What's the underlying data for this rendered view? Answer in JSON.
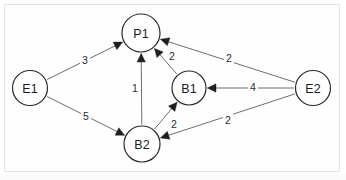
{
  "diagram": {
    "title": "",
    "type": "directed-weighted-graph",
    "background_color": "#ffffff",
    "frame_color": "#e3e3e3",
    "node_stroke_color": "#2a2a2a",
    "edge_color": "#6e6e6e",
    "arrow_color": "#1f1f1f",
    "nodes": [
      {
        "id": "E1",
        "label": "E1",
        "cx": 30,
        "cy": 88,
        "r": 17.5
      },
      {
        "id": "P1",
        "label": "P1",
        "cx": 141,
        "cy": 33,
        "r": 19.0
      },
      {
        "id": "B1",
        "label": "B1",
        "cx": 189,
        "cy": 88,
        "r": 17.0
      },
      {
        "id": "B2",
        "label": "B2",
        "cx": 142,
        "cy": 144,
        "r": 18.0
      },
      {
        "id": "E2",
        "label": "E2",
        "cx": 313,
        "cy": 88,
        "r": 17.5
      }
    ],
    "edges": [
      {
        "id": "e1-p1",
        "from": "E1",
        "to": "P1",
        "weight": "3",
        "label_x": 85,
        "label_y": 60
      },
      {
        "id": "e1-b2",
        "from": "E1",
        "to": "B2",
        "weight": "5",
        "label_x": 86,
        "label_y": 116
      },
      {
        "id": "b2-p1",
        "from": "B2",
        "to": "P1",
        "weight": "1",
        "label_x": 135,
        "label_y": 88
      },
      {
        "id": "b1-p1",
        "from": "B1",
        "to": "P1",
        "weight": "2",
        "label_x": 172,
        "label_y": 56
      },
      {
        "id": "e2-p1",
        "from": "E2",
        "to": "P1",
        "weight": "2",
        "label_x": 229,
        "label_y": 58
      },
      {
        "id": "e2-b1",
        "from": "E2",
        "to": "B1",
        "weight": "4",
        "label_x": 253,
        "label_y": 87
      },
      {
        "id": "b2-b1",
        "from": "B2",
        "to": "B1",
        "weight": "2",
        "label_x": 174,
        "label_y": 124
      },
      {
        "id": "e2-b2",
        "from": "E2",
        "to": "B2",
        "weight": "2",
        "label_x": 228,
        "label_y": 120
      }
    ]
  }
}
